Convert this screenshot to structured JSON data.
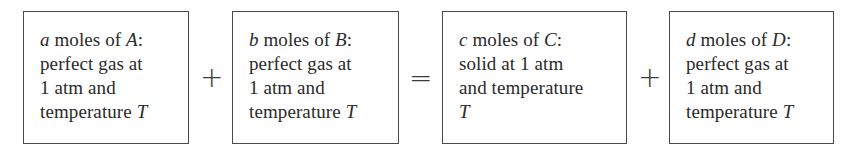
{
  "diagram": {
    "type": "reaction-equation",
    "terms": [
      {
        "id": "A",
        "coefficient": "a",
        "label_mid": " moles of ",
        "species": "A",
        "colon": ":",
        "lines": [
          "perfect gas at",
          "1 atm and"
        ],
        "last_line_text": "temperature ",
        "last_line_var": "T"
      },
      {
        "id": "B",
        "coefficient": "b",
        "label_mid": " moles of ",
        "species": "B",
        "colon": ":",
        "lines": [
          "perfect gas at",
          "1 atm and"
        ],
        "last_line_text": "temperature ",
        "last_line_var": "T"
      },
      {
        "id": "C",
        "coefficient": "c",
        "label_mid": " moles of ",
        "species": "C",
        "colon": ":",
        "lines": [
          "solid at 1 atm",
          "and temperature"
        ],
        "last_line_text": "",
        "last_line_var": "T"
      },
      {
        "id": "D",
        "coefficient": "d",
        "label_mid": " moles of ",
        "species": "D",
        "colon": ":",
        "lines": [
          "perfect gas at",
          "1 atm and"
        ],
        "last_line_text": "temperature ",
        "last_line_var": "T"
      }
    ],
    "operators": [
      "+",
      "=",
      "+"
    ]
  }
}
